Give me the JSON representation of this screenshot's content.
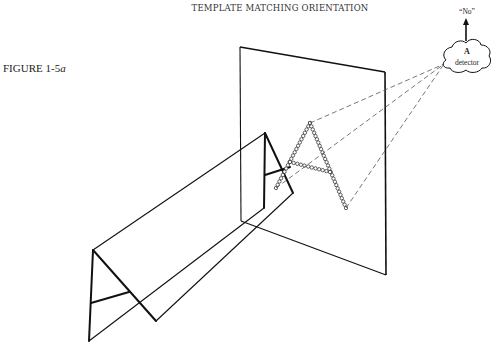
{
  "header": {
    "title": "TEMPLATE MATCHING ORIENTATION"
  },
  "figure": {
    "label_prefix": "FIGURE 1-5",
    "label_suffix": "a"
  },
  "detector": {
    "output": "“No”",
    "letter": "A",
    "name": "detector"
  },
  "colors": {
    "ink": "#111111",
    "dashed": "#555555"
  }
}
